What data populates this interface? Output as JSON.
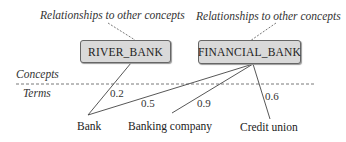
{
  "annotations": {
    "left_relationship": "Relationships to other concepts",
    "right_relationship": "Relationships to other concepts"
  },
  "layers": {
    "concepts": "Concepts",
    "terms": "Terms"
  },
  "concepts": [
    {
      "id": "river_bank",
      "label": "RIVER_BANK"
    },
    {
      "id": "financial_bank",
      "label": "FINANCIAL_BANK"
    }
  ],
  "terms": [
    {
      "id": "bank",
      "label": "Bank"
    },
    {
      "id": "banking_company",
      "label": "Banking company"
    },
    {
      "id": "credit_union",
      "label": "Credit union"
    }
  ],
  "edges": [
    {
      "from": "bank",
      "to": "river_bank",
      "weight": "0.2"
    },
    {
      "from": "bank",
      "to": "financial_bank",
      "weight": "0.5"
    },
    {
      "from": "banking_company",
      "to": "financial_bank",
      "weight": "0.9"
    },
    {
      "from": "credit_union",
      "to": "financial_bank",
      "weight": "0.6"
    }
  ],
  "colors": {
    "box_fill": "#d9d9d9",
    "box_border": "#666666",
    "line": "#444444"
  }
}
